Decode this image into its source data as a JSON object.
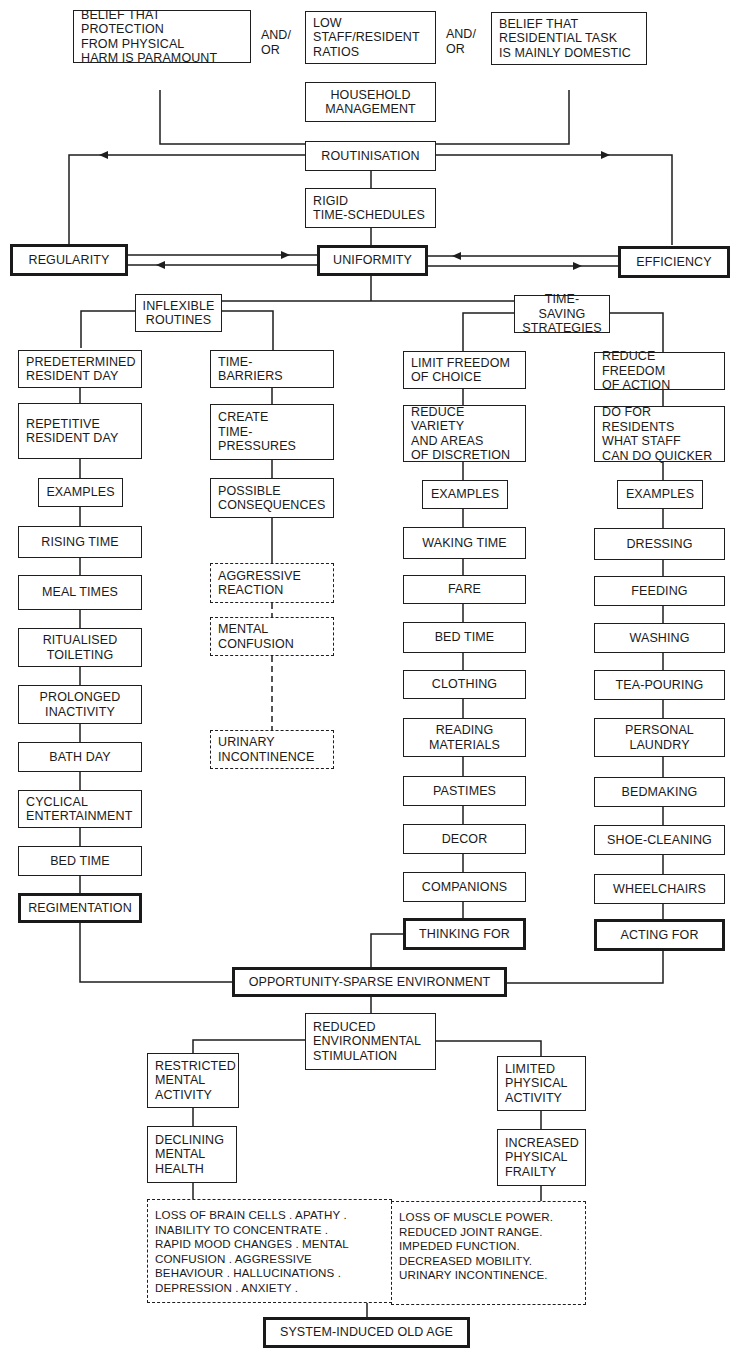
{
  "diagram": {
    "colors": {
      "ink": "#1e1e1e",
      "background": "#ffffff"
    },
    "causes": {
      "protection": "BELIEF THAT PROTECTION\nFROM PHYSICAL\nHARM IS PARAMOUNT",
      "conj_1": "AND/\nOR",
      "ratios": "LOW\nSTAFF/RESIDENT\nRATIOS",
      "conj_2": "AND/\nOR",
      "domestic": "BELIEF THAT\nRESIDENTIAL TASK\nIS MAINLY DOMESTIC"
    },
    "core": {
      "household": "HOUSEHOLD\nMANAGEMENT",
      "routinisation": "ROUTINISATION",
      "rigid": "RIGID\nTIME-SCHEDULES",
      "regularity": "REGULARITY",
      "uniformity": "UNIFORMITY",
      "efficiency": "EFFICIENCY"
    },
    "branches": {
      "inflexible": "INFLEXIBLE\nROUTINES",
      "timesaving": "TIME-SAVING\nSTRATEGIES"
    },
    "col1": {
      "items": [
        "PREDETERMINED\nRESIDENT DAY",
        "REPETITIVE\nRESIDENT DAY",
        "EXAMPLES",
        "RISING TIME",
        "MEAL TIMES",
        "RITUALISED\nTOILETING",
        "PROLONGED\nINACTIVITY",
        "BATH DAY",
        "CYCLICAL\nENTERTAINMENT",
        "BED TIME"
      ],
      "outcome": "REGIMENTATION"
    },
    "col2": {
      "items": [
        "TIME-\nBARRIERS",
        "CREATE\nTIME-PRESSURES",
        "POSSIBLE\nCONSEQUENCES"
      ],
      "consequences": [
        "AGGRESSIVE\nREACTION",
        "MENTAL\nCONFUSION",
        "URINARY\nINCONTINENCE"
      ]
    },
    "col3": {
      "items": [
        "LIMIT FREEDOM\nOF CHOICE",
        "REDUCE VARIETY\nAND AREAS\nOF DISCRETION",
        "EXAMPLES",
        "WAKING TIME",
        "FARE",
        "BED TIME",
        "CLOTHING",
        "READING\nMATERIALS",
        "PASTIMES",
        "DECOR",
        "COMPANIONS"
      ],
      "outcome": "THINKING FOR"
    },
    "col4": {
      "items": [
        "REDUCE FREEDOM\nOF ACTION",
        "DO FOR RESIDENTS\nWHAT STAFF\nCAN DO QUICKER",
        "EXAMPLES",
        "DRESSING",
        "FEEDING",
        "WASHING",
        "TEA-POURING",
        "PERSONAL\nLAUNDRY",
        "BEDMAKING",
        "SHOE-CLEANING",
        "WHEELCHAIRS"
      ],
      "outcome": "ACTING FOR"
    },
    "environment": {
      "opportunity": "OPPORTUNITY-SPARSE ENVIRONMENT",
      "reduced": "REDUCED\nENVIRONMENTAL\nSTIMULATION",
      "mental_activity": "RESTRICTED\nMENTAL\nACTIVITY",
      "physical_activity": "LIMITED\nPHYSICAL\nACTIVITY",
      "mental_health": "DECLINING\nMENTAL\nHEALTH",
      "physical_frailty": "INCREASED\nPHYSICAL\nFRAILTY",
      "mental_symptoms": "LOSS OF BRAIN CELLS . APATHY .\nINABILITY TO CONCENTRATE .\nRAPID MOOD CHANGES . MENTAL\nCONFUSION . AGGRESSIVE\nBEHAVIOUR . HALLUCINATIONS .\nDEPRESSION . ANXIETY .",
      "physical_symptoms": "LOSS OF MUSCLE POWER.\nREDUCED JOINT RANGE.\nIMPEDED FUNCTION.\nDECREASED MOBILITY.\nURINARY INCONTINENCE.",
      "final": "SYSTEM-INDUCED OLD AGE"
    }
  }
}
